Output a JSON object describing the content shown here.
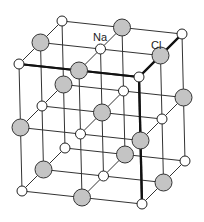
{
  "figure": {
    "labels": [
      {
        "text": "Na",
        "x": 93,
        "y": 41
      },
      {
        "text": "Cl",
        "x": 151,
        "y": 49
      }
    ],
    "lattice": {
      "size": 3,
      "origin": [
        19,
        64
      ],
      "step_right": [
        60,
        6.5
      ],
      "step_depth": [
        21.5,
        -21.5
      ],
      "step_down": [
        1.5,
        63.5
      ],
      "thick_edges": [
        [
          [
            0,
            0,
            0
          ],
          [
            2,
            0,
            0
          ]
        ],
        [
          [
            2,
            0,
            0
          ],
          [
            2,
            2,
            0
          ]
        ],
        [
          [
            2,
            0,
            0
          ],
          [
            2,
            0,
            2
          ]
        ]
      ]
    },
    "atoms": {
      "na": {
        "name": "Na",
        "radius": 5,
        "fill": "#ffffff",
        "stroke": "#222222"
      },
      "cl": {
        "name": "Cl",
        "radius": 8.5,
        "fill": "#c4c4c4",
        "stroke": "#333333"
      }
    },
    "colors": {
      "line": "#333333",
      "background": "#ffffff"
    }
  }
}
